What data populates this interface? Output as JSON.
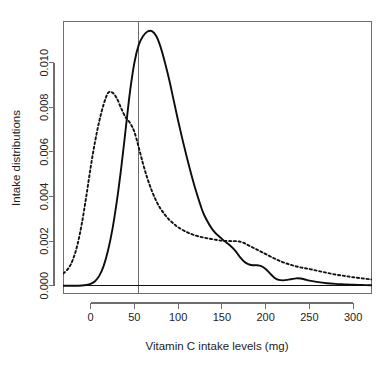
{
  "chart_data": {
    "type": "line",
    "title": "",
    "xlabel": "Vitamin C intake levels (mg)",
    "ylabel": "Intake distributions",
    "xlim": [
      -31,
      321
    ],
    "ylim": [
      -0.00035,
      0.01185
    ],
    "xticks": [
      0,
      50,
      100,
      150,
      200,
      250,
      300
    ],
    "xtick_labels": [
      "0",
      "50",
      "100",
      "150",
      "200",
      "250",
      "300"
    ],
    "yticks": [
      0.0,
      0.002,
      0.004,
      0.006,
      0.008,
      0.01
    ],
    "ytick_labels": [
      "0.000",
      "0.002",
      "0.004",
      "0.006",
      "0.008",
      "0.010"
    ],
    "grid": false,
    "legend": null,
    "annotations": [
      {
        "name": "reference-line",
        "type": "vline",
        "x": 55,
        "style": "solid",
        "color": "#6b6b6b"
      },
      {
        "name": "zero-baseline",
        "type": "hline",
        "y": 0.0,
        "style": "solid",
        "color": "#101010"
      }
    ],
    "series": [
      {
        "name": "solid-distribution",
        "style": "solid",
        "color": "#0d0d0d",
        "peak_x": 70,
        "peak_y": 0.0114,
        "x": [
          -31,
          -20,
          -10,
          -5,
          0,
          5,
          10,
          15,
          20,
          25,
          30,
          35,
          40,
          45,
          50,
          55,
          60,
          65,
          70,
          75,
          80,
          85,
          90,
          95,
          100,
          105,
          110,
          115,
          120,
          125,
          130,
          140,
          150,
          160,
          165,
          170,
          175,
          180,
          185,
          190,
          195,
          200,
          205,
          210,
          215,
          220,
          225,
          230,
          235,
          240,
          245,
          250,
          260,
          270,
          280,
          290,
          300,
          310,
          321
        ],
        "y": [
          0.0,
          0.0,
          1e-05,
          3e-05,
          8e-05,
          0.0002,
          0.00045,
          0.0009,
          0.0016,
          0.00255,
          0.0038,
          0.0053,
          0.007,
          0.0087,
          0.01,
          0.0108,
          0.0112,
          0.0114,
          0.01142,
          0.0112,
          0.0107,
          0.01,
          0.0092,
          0.0083,
          0.0074,
          0.00655,
          0.00575,
          0.005,
          0.0043,
          0.00368,
          0.00315,
          0.00248,
          0.0021,
          0.00178,
          0.00158,
          0.00132,
          0.0011,
          0.00097,
          0.00092,
          0.00092,
          0.00088,
          0.00075,
          0.00055,
          0.00036,
          0.00026,
          0.00024,
          0.00026,
          0.0003,
          0.00033,
          0.00032,
          0.00028,
          0.00023,
          0.00016,
          0.00011,
          8e-05,
          6e-05,
          4e-05,
          3e-05,
          2e-05
        ]
      },
      {
        "name": "dashed-distribution",
        "style": "dashed",
        "color": "#111111",
        "peak_x": 22,
        "peak_y": 0.0087,
        "x": [
          -31,
          -25,
          -20,
          -15,
          -10,
          -5,
          0,
          5,
          10,
          15,
          20,
          25,
          30,
          35,
          40,
          45,
          50,
          55,
          60,
          65,
          70,
          75,
          80,
          85,
          90,
          95,
          100,
          110,
          120,
          130,
          140,
          150,
          160,
          165,
          170,
          175,
          180,
          185,
          190,
          195,
          200,
          210,
          220,
          230,
          240,
          250,
          260,
          270,
          280,
          290,
          300,
          310,
          321
        ],
        "y": [
          0.00055,
          0.0008,
          0.0012,
          0.00185,
          0.0028,
          0.004,
          0.0053,
          0.00645,
          0.0074,
          0.00815,
          0.00865,
          0.00866,
          0.0084,
          0.00795,
          0.00755,
          0.0073,
          0.0069,
          0.0062,
          0.00545,
          0.0048,
          0.00425,
          0.0038,
          0.00345,
          0.00318,
          0.00295,
          0.00278,
          0.00262,
          0.0024,
          0.00225,
          0.00215,
          0.00208,
          0.00202,
          0.002,
          0.002,
          0.00198,
          0.00192,
          0.00182,
          0.00172,
          0.00162,
          0.00152,
          0.00142,
          0.00122,
          0.00105,
          0.00092,
          0.00082,
          0.00075,
          0.00066,
          0.00058,
          0.0005,
          0.00044,
          0.00038,
          0.00033,
          0.00028
        ]
      }
    ]
  },
  "figure": {
    "background": "#ffffff",
    "frame_color": "#6e6e6e"
  }
}
